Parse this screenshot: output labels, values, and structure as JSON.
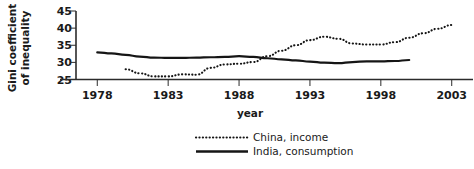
{
  "chart_data": {
    "type": "line",
    "title": "",
    "xlabel": "year",
    "ylabel": "Gini coefficient of inequality",
    "ylabel_line1": "Gini coefficient",
    "ylabel_line2": "of inequality",
    "xlim": [
      1976.5,
      2004.5
    ],
    "ylim": [
      25,
      45
    ],
    "xticks": [
      1978,
      1983,
      1988,
      1993,
      1998,
      2003
    ],
    "yticks": [
      25,
      30,
      35,
      40,
      45
    ],
    "grid": false,
    "legend_position": "bottom-center",
    "series": [
      {
        "name": "China, income",
        "style": "dotted",
        "color": "#151515",
        "x": [
          1980,
          1981,
          1982,
          1983,
          1984,
          1985,
          1986,
          1987,
          1988,
          1989,
          1990,
          1991,
          1992,
          1993,
          1994,
          1995,
          1996,
          1997,
          1998,
          1999,
          2000,
          2001,
          2002,
          2003
        ],
        "values": [
          28.0,
          26.8,
          25.9,
          25.9,
          26.5,
          26.4,
          28.4,
          29.4,
          29.6,
          30.1,
          31.8,
          33.4,
          35.0,
          36.5,
          37.5,
          36.9,
          35.5,
          35.2,
          35.2,
          35.9,
          37.2,
          38.5,
          39.8,
          40.9
        ]
      },
      {
        "name": "India, consumption",
        "style": "solid",
        "color": "#151515",
        "x": [
          1978,
          1979,
          1980,
          1981,
          1982,
          1983,
          1984,
          1985,
          1986,
          1987,
          1988,
          1989,
          1990,
          1991,
          1992,
          1993,
          1994,
          1995,
          1996,
          1997,
          1998,
          1999,
          2000
        ],
        "values": [
          32.9,
          32.6,
          32.2,
          31.7,
          31.4,
          31.3,
          31.3,
          31.4,
          31.5,
          31.6,
          31.8,
          31.6,
          31.2,
          30.9,
          30.6,
          30.2,
          29.9,
          29.8,
          30.1,
          30.3,
          30.3,
          30.4,
          30.7
        ]
      }
    ]
  },
  "legend": {
    "items": [
      {
        "label": "China, income",
        "style": "dotted"
      },
      {
        "label": "India, consumption",
        "style": "solid"
      }
    ]
  }
}
